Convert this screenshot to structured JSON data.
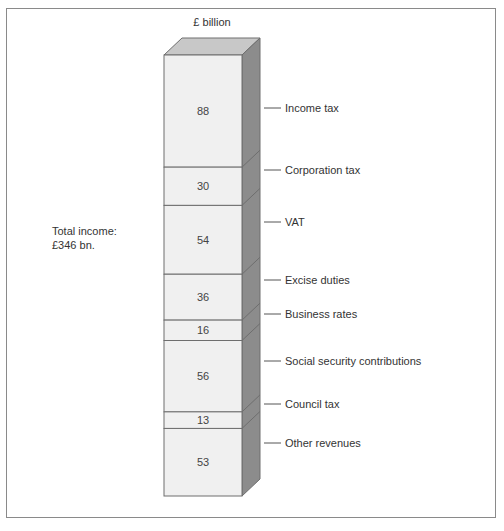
{
  "chart_data": {
    "type": "bar",
    "subtype": "stacked-single-column-3d",
    "title": "",
    "unit_label": "£ billion",
    "annotation": [
      "Total income:",
      "£346 bn."
    ],
    "total": 346,
    "categories": [
      "Income tax",
      "Corporation tax",
      "VAT",
      "Excise duties",
      "Business rates",
      "Social security contributions",
      "Council tax",
      "Other revenues"
    ],
    "values": [
      88,
      30,
      54,
      36,
      16,
      56,
      13,
      53
    ],
    "xlabel": "",
    "ylabel": "£ billion",
    "grid": false,
    "legend_position": "right-labels"
  },
  "colors": {
    "front": "#f0f0f0",
    "top": "#c8c8c8",
    "side": "#8c8c8c",
    "edge": "#6e6e6e",
    "frame": "#8a8a8a"
  },
  "header": {
    "unit": "£ billion"
  },
  "summary": {
    "line1": "Total income:",
    "line2": "£346 bn."
  }
}
